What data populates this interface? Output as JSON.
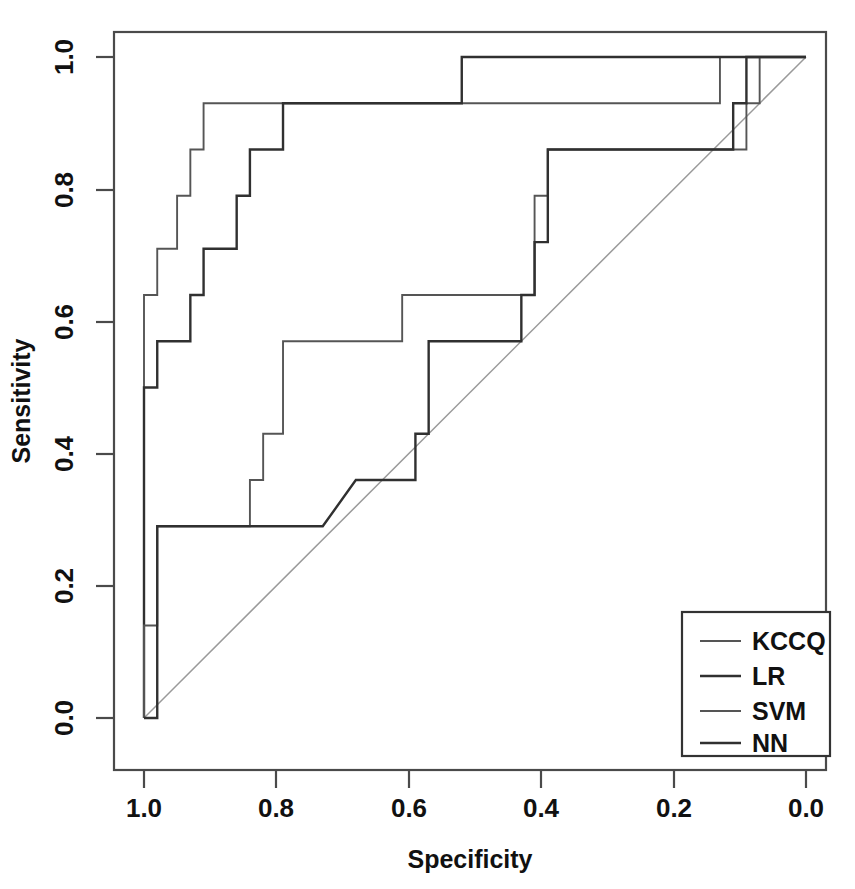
{
  "figure": {
    "name": "roc-curve-plot",
    "background": "#ffffff",
    "line_color": "#303030",
    "diagonal_color": "#9a9a9a",
    "frame_color": "#4a4a4a"
  },
  "axes": {
    "x_title": "Specificity",
    "y_title": "Sensitivity",
    "x_ticks": [
      "1.0",
      "0.8",
      "0.6",
      "0.4",
      "0.2",
      "0.0"
    ],
    "y_ticks": [
      "0.0",
      "0.2",
      "0.4",
      "0.6",
      "0.8",
      "1.0"
    ]
  },
  "legend": {
    "entries": [
      {
        "label": "KCCQ",
        "style": "thin"
      },
      {
        "label": "LR",
        "style": "thick"
      },
      {
        "label": "SVM",
        "style": "thin"
      },
      {
        "label": "NN",
        "style": "thick"
      }
    ]
  },
  "chart_data": {
    "type": "line",
    "subtype": "roc-step",
    "title": "",
    "xlabel": "Specificity",
    "ylabel": "Sensitivity",
    "xlim": [
      1.0,
      0.0
    ],
    "ylim": [
      0.0,
      1.0
    ],
    "x_reversed": true,
    "grid": false,
    "legend_position": "bottom-right",
    "reference_line": {
      "name": "chance-diagonal",
      "from": [
        1.0,
        0.0
      ],
      "to": [
        0.0,
        1.0
      ]
    },
    "series": [
      {
        "name": "KCCQ",
        "style": "thin",
        "points": [
          [
            1.0,
            0.0
          ],
          [
            1.0,
            0.64
          ],
          [
            0.98,
            0.64
          ],
          [
            0.98,
            0.71
          ],
          [
            0.95,
            0.71
          ],
          [
            0.95,
            0.79
          ],
          [
            0.93,
            0.79
          ],
          [
            0.93,
            0.86
          ],
          [
            0.91,
            0.86
          ],
          [
            0.91,
            0.93
          ],
          [
            0.13,
            0.93
          ],
          [
            0.13,
            1.0
          ],
          [
            0.0,
            1.0
          ]
        ]
      },
      {
        "name": "LR",
        "style": "thick",
        "points": [
          [
            1.0,
            0.0
          ],
          [
            1.0,
            0.5
          ],
          [
            0.98,
            0.5
          ],
          [
            0.98,
            0.57
          ],
          [
            0.93,
            0.57
          ],
          [
            0.93,
            0.64
          ],
          [
            0.91,
            0.64
          ],
          [
            0.91,
            0.71
          ],
          [
            0.86,
            0.71
          ],
          [
            0.86,
            0.79
          ],
          [
            0.84,
            0.79
          ],
          [
            0.84,
            0.86
          ],
          [
            0.79,
            0.86
          ],
          [
            0.79,
            0.93
          ],
          [
            0.52,
            0.93
          ],
          [
            0.52,
            1.0
          ],
          [
            0.0,
            1.0
          ]
        ]
      },
      {
        "name": "SVM",
        "style": "thin",
        "points": [
          [
            1.0,
            0.0
          ],
          [
            1.0,
            0.14
          ],
          [
            0.98,
            0.14
          ],
          [
            0.98,
            0.29
          ],
          [
            0.84,
            0.29
          ],
          [
            0.84,
            0.36
          ],
          [
            0.82,
            0.36
          ],
          [
            0.82,
            0.43
          ],
          [
            0.79,
            0.43
          ],
          [
            0.79,
            0.57
          ],
          [
            0.61,
            0.57
          ],
          [
            0.61,
            0.64
          ],
          [
            0.41,
            0.64
          ],
          [
            0.41,
            0.79
          ],
          [
            0.39,
            0.79
          ],
          [
            0.39,
            0.86
          ],
          [
            0.09,
            0.86
          ],
          [
            0.09,
            0.93
          ],
          [
            0.07,
            0.93
          ],
          [
            0.07,
            1.0
          ],
          [
            0.0,
            1.0
          ]
        ]
      },
      {
        "name": "NN",
        "style": "thick",
        "points": [
          [
            1.0,
            0.0
          ],
          [
            0.98,
            0.0
          ],
          [
            0.98,
            0.29
          ],
          [
            0.73,
            0.29
          ],
          [
            0.68,
            0.36
          ],
          [
            0.59,
            0.36
          ],
          [
            0.59,
            0.43
          ],
          [
            0.57,
            0.43
          ],
          [
            0.57,
            0.57
          ],
          [
            0.43,
            0.57
          ],
          [
            0.43,
            0.64
          ],
          [
            0.41,
            0.64
          ],
          [
            0.41,
            0.72
          ],
          [
            0.39,
            0.72
          ],
          [
            0.39,
            0.86
          ],
          [
            0.11,
            0.86
          ],
          [
            0.11,
            0.93
          ],
          [
            0.09,
            0.93
          ],
          [
            0.09,
            1.0
          ],
          [
            0.0,
            1.0
          ]
        ]
      }
    ]
  }
}
